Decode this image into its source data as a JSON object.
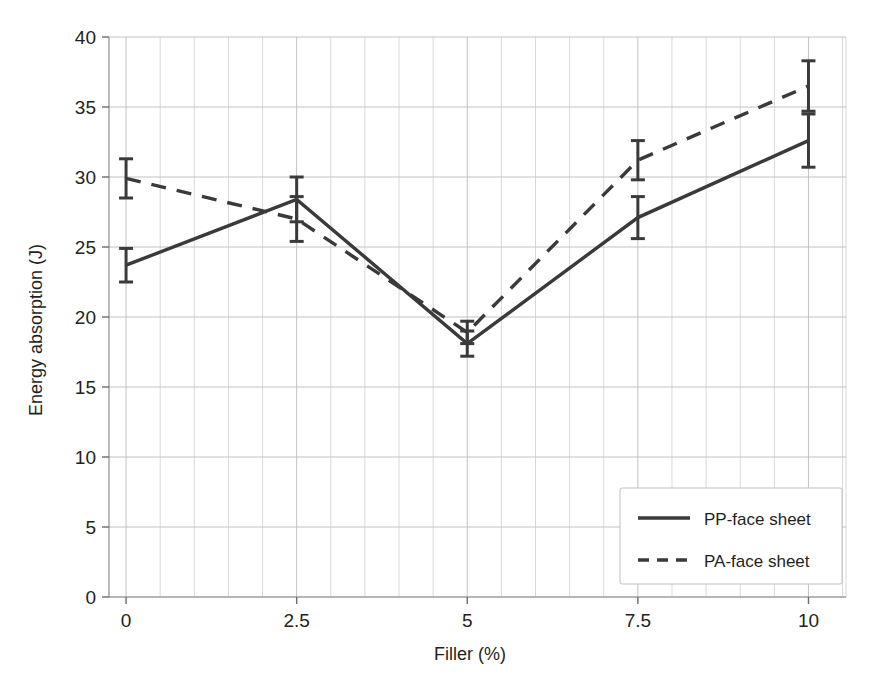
{
  "chart_data": {
    "type": "line",
    "title": "",
    "xlabel": "Filler (%)",
    "ylabel": "Energy absorption (J)",
    "x": [
      0,
      2.5,
      5,
      7.5,
      10
    ],
    "xtick_labels": [
      "0",
      "2.5",
      "5",
      "7.5",
      "10"
    ],
    "ytick_labels": [
      "0",
      "5",
      "10",
      "15",
      "20",
      "25",
      "30",
      "35",
      "40"
    ],
    "ytick_values": [
      0,
      5,
      10,
      15,
      20,
      25,
      30,
      35,
      40
    ],
    "xlim": [
      -0.25,
      10.55
    ],
    "ylim": [
      0,
      40
    ],
    "grid": true,
    "grid_minor_x_step": 0.5,
    "legend_position": "lower right",
    "series": [
      {
        "name": "PP-face sheet",
        "style": "solid",
        "color": "#3a3a3a",
        "values": [
          23.7,
          28.4,
          18.1,
          27.1,
          32.6
        ],
        "errors": [
          1.2,
          1.6,
          0.9,
          1.5,
          1.9
        ]
      },
      {
        "name": "PA-face sheet",
        "style": "dashed",
        "color": "#3a3a3a",
        "values": [
          29.9,
          27.0,
          18.9,
          31.2,
          36.5
        ],
        "errors": [
          1.4,
          1.6,
          0.8,
          1.4,
          1.8
        ]
      }
    ]
  },
  "legend": {
    "entries": [
      {
        "label": "PP-face sheet",
        "style": "solid"
      },
      {
        "label": "PA-face sheet",
        "style": "dashed"
      }
    ]
  },
  "axes": {
    "x_title": "Filler (%)",
    "y_title": "Energy absorption (J)"
  }
}
